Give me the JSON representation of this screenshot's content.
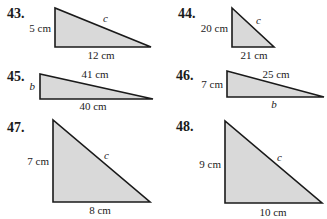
{
  "problems": [
    {
      "number": "43.",
      "leg_vertical": "5 cm",
      "leg_horizontal": "12 cm",
      "hypotenuse": "c"
    },
    {
      "number": "44.",
      "leg_vertical": "20 cm",
      "leg_horizontal": "21 cm",
      "hypotenuse": "c"
    },
    {
      "number": "45.",
      "leg_vertical": "b",
      "leg_horizontal": "40 cm",
      "hypotenuse": "41 cm"
    },
    {
      "number": "46.",
      "leg_vertical": "7 cm",
      "leg_horizontal": "b",
      "hypotenuse": "25 cm"
    },
    {
      "number": "47.",
      "leg_vertical": "7 cm",
      "leg_horizontal": "8 cm",
      "hypotenuse": "c"
    },
    {
      "number": "48.",
      "leg_vertical": "9 cm",
      "leg_horizontal": "10 cm",
      "hypotenuse": "c"
    }
  ],
  "colors": {
    "fill": "#d9d9d9",
    "stroke": "#1a1a1a"
  }
}
